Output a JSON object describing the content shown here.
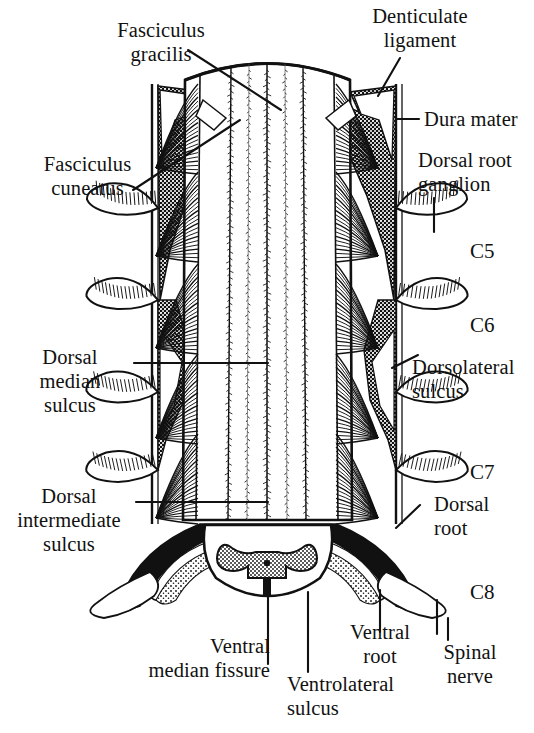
{
  "figure": {
    "background_color": "#ffffff",
    "ink_color": "#000000"
  },
  "labels": {
    "fasciculus_gracilis": "Fasciculus\ngracilis",
    "fasciculus_cuneatus": "Fasciculus\ncuneatus",
    "dorsal_median_sulcus": "Dorsal\nmedian\nsulcus",
    "dorsal_intermediate_sulcus": "Dorsal\nintermediate\nsulcus",
    "denticulate_ligament": "Denticulate\nligament",
    "dura_mater": "Dura mater",
    "dorsal_root_ganglion": "Dorsal root\nganglion",
    "dorsolateral_sulcus": "Dorsolateral\nsulcus",
    "dorsal_root": "Dorsal\nroot",
    "ventral_median_fissure": "Ventral\nmedian fissure",
    "ventrolateral_sulcus": "Ventrolateral\nsulcus",
    "ventral_root": "Ventral\nroot",
    "spinal_nerve": "Spinal\nnerve"
  },
  "segments": [
    {
      "name": "C5",
      "label": "C5"
    },
    {
      "name": "C6",
      "label": "C6"
    },
    {
      "name": "C7",
      "label": "C7"
    },
    {
      "name": "C8",
      "label": "C8"
    }
  ],
  "structures": {
    "dura_left_edge": "dura-mater-left-margin",
    "dura_right_edge": "dura-mater-right-margin",
    "cord_dome": "spinal-cord-superior-dome",
    "gray_matter": "butterfly-gray-matter",
    "central_canal": "central-canal"
  }
}
